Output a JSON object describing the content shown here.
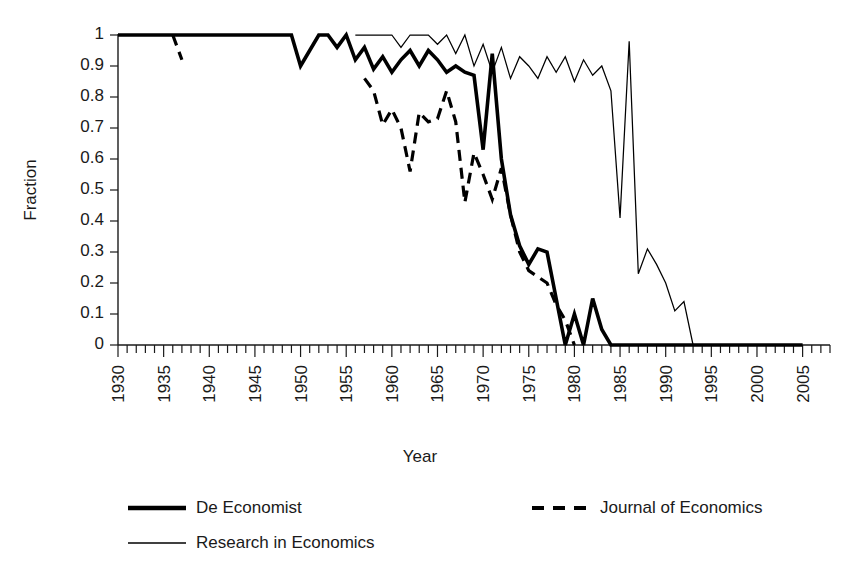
{
  "chart_data": {
    "type": "line",
    "title": "",
    "xlabel": "Year",
    "ylabel": "Fraction",
    "xlim": [
      1930,
      2008
    ],
    "ylim": [
      0,
      1
    ],
    "grid": false,
    "legend_position": "bottom",
    "y_ticks": [
      "0",
      "0.1",
      "0.2",
      "0.3",
      "0.4",
      "0.5",
      "0.6",
      "0.7",
      "0.8",
      "0.9",
      "1"
    ],
    "x_ticks": [
      "1930",
      "1935",
      "1940",
      "1945",
      "1950",
      "1955",
      "1960",
      "1965",
      "1970",
      "1975",
      "1980",
      "1985",
      "1990",
      "1995",
      "2000",
      "2005"
    ],
    "x_tick_interval_minor": 1,
    "x_tick_interval_major": 5,
    "series": [
      {
        "name": "De Economist",
        "style": "thick-solid",
        "color": "#000000",
        "x": [
          1930,
          1931,
          1932,
          1933,
          1934,
          1935,
          1936,
          1937,
          1938,
          1939,
          1940,
          1941,
          1942,
          1943,
          1944,
          1945,
          1946,
          1947,
          1948,
          1949,
          1950,
          1951,
          1952,
          1953,
          1954,
          1955,
          1956,
          1957,
          1958,
          1959,
          1960,
          1961,
          1962,
          1963,
          1964,
          1965,
          1966,
          1967,
          1968,
          1969,
          1970,
          1971,
          1972,
          1973,
          1974,
          1975,
          1976,
          1977,
          1978,
          1979,
          1980,
          1981,
          1982,
          1983,
          1984,
          1985,
          1986,
          1987,
          1988,
          1989,
          1990,
          1991,
          1992,
          1993,
          1994,
          1995,
          1996,
          1997,
          1998,
          1999,
          2000,
          2001,
          2002,
          2003,
          2004,
          2005
        ],
        "y": [
          1,
          1,
          1,
          1,
          1,
          1,
          1,
          1,
          1,
          1,
          1,
          1,
          1,
          1,
          1,
          1,
          1,
          1,
          1,
          1,
          0.9,
          0.95,
          1,
          1,
          0.96,
          1,
          0.92,
          0.96,
          0.89,
          0.93,
          0.88,
          0.92,
          0.95,
          0.9,
          0.95,
          0.92,
          0.88,
          0.9,
          0.88,
          0.87,
          0.63,
          0.94,
          0.6,
          0.42,
          0.32,
          0.26,
          0.31,
          0.3,
          0.15,
          0.0,
          0.1,
          0.0,
          0.15,
          0.05,
          0,
          0,
          0,
          0,
          0,
          0,
          0,
          0,
          0,
          0,
          0,
          0,
          0,
          0,
          0,
          0,
          0,
          0,
          0,
          0,
          0,
          0
        ]
      },
      {
        "name": "Journal of Economics",
        "style": "dashed",
        "color": "#000000",
        "segments": [
          {
            "x": [
              1936,
              1937
            ],
            "y": [
              1,
              0.92
            ]
          },
          {
            "x": [
              1957,
              1958,
              1959,
              1960,
              1961,
              1962,
              1963,
              1964,
              1965,
              1966,
              1967,
              1968,
              1969,
              1970,
              1971,
              1972,
              1973,
              1974,
              1975,
              1976,
              1977,
              1978,
              1979,
              1980
            ],
            "y": [
              0.86,
              0.82,
              0.71,
              0.76,
              0.7,
              0.56,
              0.75,
              0.72,
              0.73,
              0.82,
              0.72,
              0.46,
              0.62,
              0.55,
              0.47,
              0.57,
              0.42,
              0.3,
              0.24,
              0.22,
              0.2,
              0.13,
              0.08,
              0.0
            ]
          }
        ]
      },
      {
        "name": "Research in Economics",
        "style": "thin-solid",
        "color": "#000000",
        "x": [
          1956,
          1957,
          1958,
          1959,
          1960,
          1961,
          1962,
          1963,
          1964,
          1965,
          1966,
          1967,
          1968,
          1969,
          1970,
          1971,
          1972,
          1973,
          1974,
          1975,
          1976,
          1977,
          1978,
          1979,
          1980,
          1981,
          1982,
          1983,
          1984,
          1985,
          1986,
          1987,
          1988,
          1989,
          1990,
          1991,
          1992,
          1993
        ],
        "y": [
          1,
          1,
          1,
          1,
          1,
          0.96,
          1,
          1,
          1,
          0.97,
          1,
          0.94,
          1,
          0.9,
          0.97,
          0.88,
          0.96,
          0.86,
          0.93,
          0.9,
          0.86,
          0.93,
          0.88,
          0.93,
          0.85,
          0.92,
          0.87,
          0.9,
          0.82,
          0.41,
          0.98,
          0.23,
          0.31,
          0.26,
          0.2,
          0.11,
          0.14,
          0.0
        ]
      }
    ]
  },
  "legend": {
    "entries": [
      {
        "label": "De Economist",
        "style": "thick-solid"
      },
      {
        "label": "Journal of Economics",
        "style": "dashed"
      },
      {
        "label": "Research in Economics",
        "style": "thin-solid"
      }
    ]
  }
}
